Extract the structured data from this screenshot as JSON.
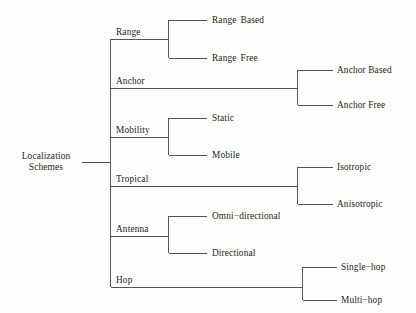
{
  "figure": {
    "kind": "hierarchy-tree",
    "orientation": "horizontal-left-to-right",
    "background_color": "#fdfdfb",
    "line_color": "#555555",
    "text_color": "#1d1d1d"
  },
  "root": {
    "line1": "Localization",
    "line2": "Schemes"
  },
  "branches": [
    {
      "id": "range",
      "label": "Range",
      "leaves": [
        {
          "id": "range-based",
          "label": "Range  Based"
        },
        {
          "id": "range-free",
          "label": "Range  Free"
        }
      ]
    },
    {
      "id": "anchor",
      "label": "Anchor",
      "leaves": [
        {
          "id": "anchor-based",
          "label": "Anchor Based"
        },
        {
          "id": "anchor-free",
          "label": "Anchor Free"
        }
      ]
    },
    {
      "id": "mobility",
      "label": "Mobility",
      "leaves": [
        {
          "id": "static",
          "label": "Static"
        },
        {
          "id": "mobile",
          "label": "Mobile"
        }
      ]
    },
    {
      "id": "tropical",
      "label": "Tropical",
      "leaves": [
        {
          "id": "isotropic",
          "label": "Isotropic"
        },
        {
          "id": "anisotropic",
          "label": "Anisotropic"
        }
      ]
    },
    {
      "id": "antenna",
      "label": "Antenna",
      "leaves": [
        {
          "id": "omni-directional",
          "label": "Omni−directional"
        },
        {
          "id": "directional",
          "label": "Directional"
        }
      ]
    },
    {
      "id": "hop",
      "label": "Hop",
      "leaves": [
        {
          "id": "single-hop",
          "label": "Single−hop"
        },
        {
          "id": "multi-hop",
          "label": "Multi−hop"
        }
      ]
    }
  ]
}
